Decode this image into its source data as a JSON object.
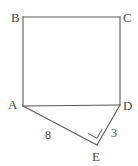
{
  "figure": {
    "type": "geometry-diagram",
    "width": 138,
    "height": 166,
    "background_color": "#fefefe",
    "stroke_color": "#5a5a5a",
    "text_color": "#4a4a4a",
    "vertices": [
      {
        "name": "B",
        "label": "B",
        "x": 23,
        "y": 17,
        "label_x": 11,
        "label_y": 11
      },
      {
        "name": "C",
        "label": "C",
        "x": 120,
        "y": 17,
        "label_x": 123,
        "label_y": 11
      },
      {
        "name": "A",
        "label": "A",
        "x": 23,
        "y": 106,
        "label_x": 8,
        "label_y": 98
      },
      {
        "name": "D",
        "label": "D",
        "x": 120,
        "y": 105,
        "label_x": 123,
        "label_y": 99
      },
      {
        "name": "E",
        "label": "E",
        "x": 97,
        "y": 145,
        "label_x": 92,
        "label_y": 150
      }
    ],
    "edges": [
      {
        "name": "edge-BC",
        "from": "B",
        "to": "C"
      },
      {
        "name": "edge-CD",
        "from": "C",
        "to": "D"
      },
      {
        "name": "edge-AB",
        "from": "A",
        "to": "B"
      },
      {
        "name": "edge-AD",
        "from": "A",
        "to": "D"
      },
      {
        "name": "edge-AE",
        "from": "A",
        "to": "E"
      },
      {
        "name": "edge-ED",
        "from": "E",
        "to": "D"
      }
    ],
    "measurements": [
      {
        "name": "length-AE",
        "edge": "AE",
        "value": "8",
        "label_x": 45,
        "label_y": 129
      },
      {
        "name": "length-ED",
        "edge": "ED",
        "value": "3",
        "label_x": 111,
        "label_y": 127
      }
    ],
    "right_angle": {
      "name": "right-angle-at-E",
      "at_vertex": "E",
      "between_edges": [
        "AE",
        "ED"
      ],
      "marker": "square"
    }
  }
}
